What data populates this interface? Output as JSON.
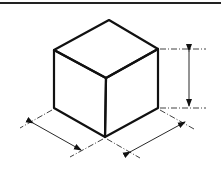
{
  "diagram": {
    "type": "isometric-cube-dimensioning",
    "colors": {
      "stroke": "#111111",
      "background": "#ffffff"
    },
    "dimensions": [
      {
        "name": "height",
        "label": ""
      },
      {
        "name": "width-left",
        "label": ""
      },
      {
        "name": "depth-right",
        "label": ""
      }
    ]
  }
}
